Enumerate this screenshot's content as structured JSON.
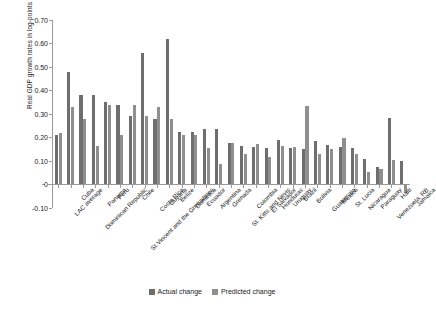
{
  "chart_data": {
    "type": "bar",
    "title": "",
    "xlabel": "",
    "ylabel": "Real GDP growth rates in log-points",
    "ylim": [
      -0.1,
      0.7
    ],
    "ytick_labels": [
      "0.70",
      "0.60",
      "0.50",
      "0.40",
      "0.30",
      "0.20",
      "0.10",
      "0",
      "-0.10"
    ],
    "ytick_values": [
      0.7,
      0.6,
      0.5,
      0.4,
      0.3,
      0.2,
      0.1,
      0.0,
      -0.1
    ],
    "grid": false,
    "legend_position": "bottom-center",
    "categories": [
      "LAC average",
      "Cuba",
      "Dominican Republic",
      "Panama",
      "Peru",
      "St.Vincent and the Grenadines",
      "Chile",
      "Costa Rica",
      "Guyana",
      "Belize",
      "Dominica",
      "Ecuador",
      "Argentina",
      "Grenada",
      "St. Kitts and Nevis",
      "Colombia",
      "El Salvador",
      "Honduras",
      "Uruguay",
      "Brazil",
      "Bolivia",
      "Guatemala",
      "Mexico",
      "St. Lucia",
      "Nicaragua",
      "Paraguay",
      "Venezuela, RB",
      "Haiti",
      "Jamaica"
    ],
    "series": [
      {
        "name": "Actual change",
        "color": "#6e6e6e",
        "values": [
          0.208,
          0.478,
          0.378,
          0.378,
          0.347,
          0.338,
          0.288,
          0.558,
          0.277,
          0.618,
          0.222,
          0.222,
          0.233,
          0.233,
          0.173,
          0.162,
          0.158,
          0.152,
          0.187,
          0.152,
          0.147,
          0.185,
          0.168,
          0.158,
          0.152,
          0.105,
          0.074,
          0.279,
          0.098
        ]
      },
      {
        "name": "Predicted change",
        "color": "#8f8f8f",
        "values": [
          0.216,
          0.329,
          0.277,
          0.16,
          0.338,
          0.208,
          0.338,
          0.288,
          0.329,
          0.277,
          0.207,
          0.207,
          0.153,
          0.085,
          0.175,
          0.128,
          0.172,
          0.117,
          0.163,
          0.158,
          0.333,
          0.128,
          0.148,
          0.195,
          0.126,
          0.05,
          0.063,
          0.101,
          -0.04
        ]
      }
    ]
  },
  "legend": {
    "items": [
      {
        "label": "Actual change",
        "color": "#6e6e6e"
      },
      {
        "label": "Predicted change",
        "color": "#8f8f8f"
      }
    ]
  }
}
